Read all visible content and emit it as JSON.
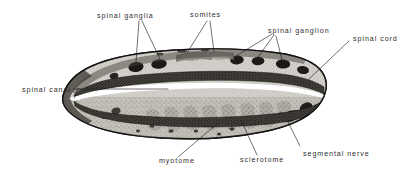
{
  "figure": {
    "background_color": "#ffffff",
    "ink_color": "#1a1a1a",
    "label_color": "#2c2c2c",
    "width": 418,
    "height": 178
  },
  "labels": {
    "spinal_ganglia": "spinal ganglia",
    "somites": "somites",
    "spinal_ganglion": "spinal ganglion",
    "spinal_cord": "spinal cord",
    "spinal_canal": "spinal canal",
    "myotome": "myotome",
    "sclerotome": "sclerotome",
    "segmental_nerve": "segmental nerve"
  },
  "specimen": {
    "outline_color": "#1c1c1c",
    "body_fill": "#cdc9c4",
    "cord_band_color": "#3a3835",
    "canal_color": "#ffffff",
    "ganglion_color": "#232323",
    "myotome_color": "#8f8a85"
  }
}
